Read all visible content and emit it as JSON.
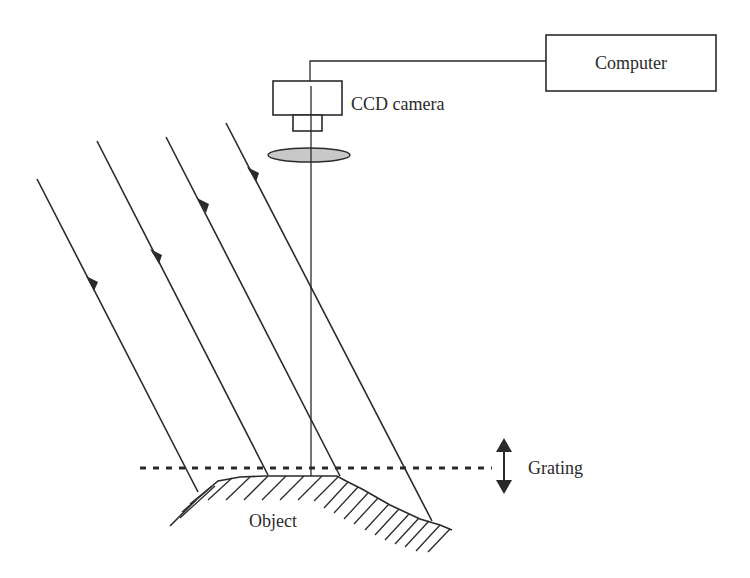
{
  "diagram": {
    "type": "fringe-projection-setup",
    "labels": {
      "computer": "Computer",
      "camera": "CCD camera",
      "grating": "Grating",
      "object": "Object"
    },
    "components": [
      {
        "id": "computer",
        "shape": "rectangle"
      },
      {
        "id": "ccd-camera",
        "shape": "camera-body-with-lens-mount"
      },
      {
        "id": "imaging-lens",
        "shape": "ellipse",
        "fill": "#c8c8c8"
      },
      {
        "id": "optical-axis",
        "shape": "vertical-line"
      },
      {
        "id": "grating",
        "shape": "dashed-line",
        "motion": "vertical double arrow"
      },
      {
        "id": "object",
        "shape": "hatched-surface"
      }
    ],
    "illumination_rays": {
      "count": 4,
      "direction": "down-right",
      "arrowheads": true
    },
    "connections": [
      {
        "from": "ccd-camera",
        "to": "computer",
        "style": "line"
      }
    ],
    "colors": {
      "stroke": "#2a2a2a",
      "lens_fill": "#c8c8c8",
      "background": "#ffffff"
    }
  }
}
